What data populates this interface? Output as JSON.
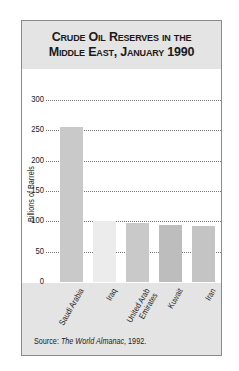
{
  "chart_data": {
    "type": "bar",
    "title": "Crude Oil Reserves in the Middle East, January 1990",
    "title_lines": [
      "Crude Oil Reserves in the",
      "Middle East, January 1990"
    ],
    "xlabel": "",
    "ylabel": "Billions of Barrels",
    "ylim": [
      0,
      300
    ],
    "yticks": [
      0,
      50,
      100,
      150,
      200,
      250,
      300
    ],
    "grid": true,
    "legend": null,
    "categories": [
      "Saudi Arabia",
      "Iraq",
      "United Arab Emirates",
      "Kuwait",
      "Iran"
    ],
    "category_labels": [
      [
        "Saudi Arabia"
      ],
      [
        "Iraq"
      ],
      [
        "United Arab",
        "Emirates"
      ],
      [
        "Kuwait"
      ],
      [
        "Iran"
      ]
    ],
    "values": [
      255,
      100,
      98,
      94,
      93
    ],
    "colors": [
      "#c9c9c9",
      "#ececec",
      "#c9c9c9",
      "#bdbdbd",
      "#c4c4c4"
    ],
    "source": {
      "prefix": "Source: ",
      "work": "The World Almanac",
      "suffix": ", 1992."
    }
  }
}
